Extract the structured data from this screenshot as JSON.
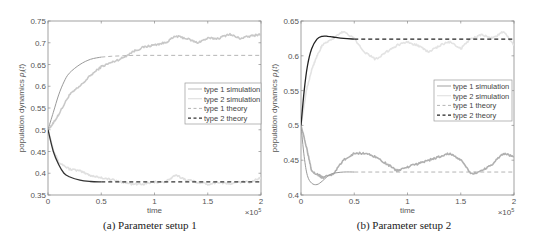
{
  "chart_data": [
    {
      "type": "line",
      "caption": "(a)  Parameter setup 1",
      "xlabel": "time",
      "ylabel": "population dynamics p_i(t)",
      "x_multiplier": "×10^5",
      "xlim": [
        0,
        2
      ],
      "ylim": [
        0.35,
        0.75
      ],
      "xticks": [
        "0",
        "0.5",
        "1",
        "1.5",
        "2"
      ],
      "yticks": [
        "0.35",
        "0.4",
        "0.45",
        "0.5",
        "0.55",
        "0.6",
        "0.65",
        "0.7",
        "0.75"
      ],
      "grid": false,
      "legend_position": "right-middle",
      "legend": [
        "type 1 simulation",
        "type 2 simulation",
        "type 1 theory",
        "type 2 theory"
      ],
      "series": [
        {
          "name": "type 1 simulation",
          "style": "solid-noisy",
          "color": "#c8c8c8",
          "x": [
            0,
            0.05,
            0.1,
            0.2,
            0.3,
            0.4,
            0.5,
            0.6,
            0.7,
            0.8,
            0.9,
            1.0,
            1.1,
            1.2,
            1.3,
            1.4,
            1.5,
            1.6,
            1.7,
            1.8,
            1.9,
            2.0
          ],
          "y": [
            0.5,
            0.515,
            0.535,
            0.58,
            0.6,
            0.625,
            0.645,
            0.655,
            0.665,
            0.68,
            0.69,
            0.695,
            0.7,
            0.715,
            0.71,
            0.7,
            0.71,
            0.71,
            0.72,
            0.71,
            0.715,
            0.72
          ]
        },
        {
          "name": "type 2 simulation",
          "style": "solid-noisy",
          "color": "#e0e0e0",
          "x": [
            0,
            0.05,
            0.1,
            0.2,
            0.3,
            0.4,
            0.5,
            0.6,
            0.7,
            0.8,
            0.9,
            1.0,
            1.1,
            1.2,
            1.3,
            1.4,
            1.5,
            1.6,
            1.7,
            1.8,
            1.9,
            2.0
          ],
          "y": [
            0.5,
            0.455,
            0.425,
            0.41,
            0.405,
            0.395,
            0.39,
            0.385,
            0.38,
            0.375,
            0.375,
            0.38,
            0.38,
            0.395,
            0.385,
            0.38,
            0.375,
            0.38,
            0.375,
            0.38,
            0.38,
            0.39
          ]
        },
        {
          "name": "type 1 theory",
          "style": "solid-then-dashed",
          "color": "#9a9a9a",
          "x": [
            0,
            0.05,
            0.1,
            0.15,
            0.2,
            0.3,
            0.4,
            0.5,
            0.6,
            0.7,
            0.8,
            1.0,
            1.5,
            2.0
          ],
          "y": [
            0.5,
            0.54,
            0.58,
            0.61,
            0.63,
            0.65,
            0.662,
            0.667,
            0.669,
            0.67,
            0.671,
            0.671,
            0.671,
            0.671
          ]
        },
        {
          "name": "type 2 theory",
          "style": "solid-then-dashed",
          "color": "#333333",
          "x": [
            0,
            0.05,
            0.1,
            0.15,
            0.2,
            0.3,
            0.4,
            0.5,
            0.6,
            1.0,
            1.5,
            2.0
          ],
          "y": [
            0.5,
            0.45,
            0.42,
            0.4,
            0.392,
            0.384,
            0.381,
            0.38,
            0.38,
            0.38,
            0.38,
            0.38
          ]
        }
      ]
    },
    {
      "type": "line",
      "caption": "(b)  Parameter setup 2",
      "xlabel": "time",
      "ylabel": "population dynamics p_i(t)",
      "x_multiplier": "×10^5",
      "xlim": [
        0,
        2
      ],
      "ylim": [
        0.4,
        0.65
      ],
      "xticks": [
        "0",
        "0.5",
        "1",
        "1.5",
        "2"
      ],
      "yticks": [
        "0.4",
        "0.45",
        "0.5",
        "0.55",
        "0.6",
        "0.65"
      ],
      "grid": false,
      "legend_position": "right-middle",
      "legend": [
        "type 1 simulation",
        "type 2 simulation",
        "type 1 theory",
        "type 2 theory"
      ],
      "series": [
        {
          "name": "type 1 simulation",
          "style": "solid-noisy",
          "color": "#b0b0b0",
          "x": [
            0,
            0.05,
            0.1,
            0.15,
            0.2,
            0.3,
            0.4,
            0.5,
            0.6,
            0.7,
            0.8,
            0.9,
            1.0,
            1.1,
            1.2,
            1.3,
            1.4,
            1.5,
            1.6,
            1.7,
            1.8,
            1.9,
            2.0
          ],
          "y": [
            0.5,
            0.47,
            0.435,
            0.43,
            0.425,
            0.43,
            0.45,
            0.46,
            0.46,
            0.455,
            0.445,
            0.435,
            0.44,
            0.445,
            0.45,
            0.455,
            0.46,
            0.45,
            0.43,
            0.435,
            0.445,
            0.46,
            0.455
          ]
        },
        {
          "name": "type 2 simulation",
          "style": "solid-noisy",
          "color": "#e3e3e3",
          "x": [
            0,
            0.05,
            0.1,
            0.15,
            0.2,
            0.3,
            0.4,
            0.5,
            0.6,
            0.7,
            0.8,
            0.9,
            1.0,
            1.1,
            1.2,
            1.3,
            1.4,
            1.5,
            1.6,
            1.7,
            1.8,
            1.9,
            2.0
          ],
          "y": [
            0.5,
            0.55,
            0.58,
            0.6,
            0.615,
            0.625,
            0.635,
            0.625,
            0.605,
            0.595,
            0.605,
            0.615,
            0.62,
            0.615,
            0.605,
            0.615,
            0.62,
            0.61,
            0.625,
            0.63,
            0.625,
            0.635,
            0.615
          ]
        },
        {
          "name": "type 1 theory",
          "style": "solid-then-dashed",
          "color": "#9a9a9a",
          "x": [
            0,
            0.03,
            0.06,
            0.1,
            0.15,
            0.2,
            0.25,
            0.3,
            0.4,
            0.5,
            1.0,
            1.5,
            2.0
          ],
          "y": [
            0.5,
            0.455,
            0.428,
            0.417,
            0.415,
            0.42,
            0.427,
            0.431,
            0.433,
            0.433,
            0.433,
            0.433,
            0.433
          ]
        },
        {
          "name": "type 2 theory",
          "style": "solid-then-dashed",
          "color": "#222222",
          "x": [
            0,
            0.03,
            0.06,
            0.1,
            0.15,
            0.2,
            0.25,
            0.3,
            0.4,
            0.5,
            1.0,
            1.5,
            2.0
          ],
          "y": [
            0.5,
            0.55,
            0.585,
            0.61,
            0.624,
            0.628,
            0.628,
            0.627,
            0.625,
            0.624,
            0.624,
            0.624,
            0.624
          ]
        }
      ]
    }
  ]
}
